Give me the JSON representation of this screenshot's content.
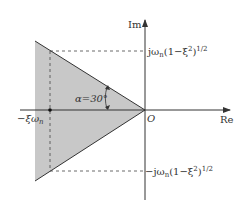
{
  "diagram": {
    "type": "s-plane-region",
    "axes": {
      "imaginary_label": "Im",
      "real_label": "Re",
      "origin_label": "O"
    },
    "angle_label": "α=30°",
    "angle_deg": 30,
    "upper_pole_label": "jω",
    "upper_pole_sub": "n",
    "upper_pole_tail": "(1−ξ",
    "upper_pole_sup1": "2",
    "upper_pole_end": ")",
    "upper_pole_sup2": "1/2",
    "lower_pole_label": "−jω",
    "lower_pole_sub": "n",
    "lower_pole_tail": "(1−ξ",
    "lower_pole_sup1": "2",
    "lower_pole_end": ")",
    "lower_pole_sup2": "1/2",
    "real_part_label": "−ξω",
    "real_part_sub": "n",
    "colors": {
      "shade": "#c8c8c8",
      "line": "#333333",
      "background": "#ffffff"
    }
  }
}
